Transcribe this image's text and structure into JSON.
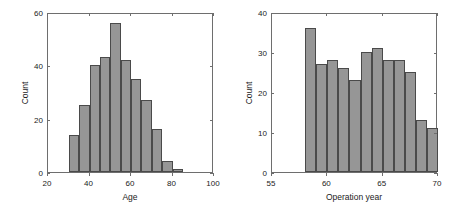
{
  "figure": {
    "background": "#ffffff",
    "bar_fill": "#969696",
    "bar_edge": "#4a4a4a",
    "axis_color": "#6e6e6e"
  },
  "chart_data": [
    {
      "type": "bar",
      "title": "",
      "xlabel": "Age",
      "ylabel": "Count",
      "xlim": [
        20,
        100
      ],
      "ylim": [
        0,
        60
      ],
      "xticks": [
        20,
        40,
        60,
        80,
        100
      ],
      "xtick_labels": [
        "20",
        "40",
        "60",
        "80",
        "100"
      ],
      "yticks": [
        0,
        20,
        40,
        60
      ],
      "ytick_labels": [
        "0",
        "20",
        "40",
        "60"
      ],
      "grid": false,
      "legend": "none",
      "bin_edges": [
        30,
        35,
        40,
        45,
        50,
        55,
        60,
        65,
        70,
        75,
        80,
        85
      ],
      "categories": [
        "30-35",
        "35-40",
        "40-45",
        "45-50",
        "50-55",
        "55-60",
        "60-65",
        "65-70",
        "70-75",
        "75-80",
        "80-85"
      ],
      "values": [
        14,
        25,
        40,
        43,
        56,
        42,
        35,
        27,
        16,
        4,
        1
      ]
    },
    {
      "type": "bar",
      "title": "",
      "xlabel": "Operation year",
      "ylabel": "Count",
      "xlim": [
        55,
        70
      ],
      "ylim": [
        0,
        40
      ],
      "xticks": [
        55,
        60,
        65,
        70
      ],
      "xtick_labels": [
        "55",
        "60",
        "65",
        "70"
      ],
      "yticks": [
        0,
        10,
        20,
        30,
        40
      ],
      "ytick_labels": [
        "0",
        "10",
        "20",
        "30",
        "40"
      ],
      "grid": false,
      "legend": "none",
      "bin_edges": [
        58,
        59,
        60,
        61,
        62,
        63,
        64,
        65,
        66,
        67,
        68,
        69,
        70
      ],
      "categories": [
        "58-59",
        "59-60",
        "60-61",
        "61-62",
        "62-63",
        "63-64",
        "64-65",
        "65-66",
        "66-67",
        "67-68",
        "68-69",
        "69-70"
      ],
      "values": [
        36,
        27,
        28,
        26,
        23,
        30,
        31,
        28,
        28,
        25,
        13,
        11
      ]
    }
  ]
}
